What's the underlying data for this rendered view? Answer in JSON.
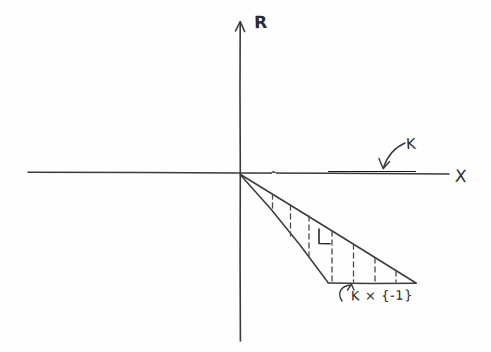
{
  "figure": {
    "kind": "hand-drawn-math-diagram",
    "background_color": "#fefefe",
    "ink_color": "#2b2b2b",
    "axes": {
      "vertical": {
        "label": "R",
        "name": "r-axis",
        "x": 240,
        "y_top": 22,
        "y_bottom": 341,
        "arrow_at": "top"
      },
      "horizontal": {
        "label": "X",
        "name": "x-axis",
        "y": 173,
        "x_left": 28,
        "x_right": 449,
        "arrow_at": "none"
      },
      "origin": {
        "x": 240,
        "y": 173
      }
    },
    "annotations": {
      "k_label": "K",
      "l_label": "L",
      "k_times_minus_one_label": "K × {-1}"
    },
    "segments": {
      "k_segment": {
        "name": "compact-set-k",
        "x_start": 328,
        "x_end": 416,
        "y": 172,
        "thickness": 5
      },
      "base_segment": {
        "name": "k-times-minus-one-segment",
        "x_start": 328,
        "x_end": 416,
        "y": 283,
        "thickness": 1.6
      }
    },
    "cone": {
      "name": "cone-region-l",
      "apex": {
        "x": 240,
        "y": 174
      },
      "upper_edge_end": {
        "x": 416,
        "y": 283
      },
      "lower_edge_end": {
        "x": 328,
        "y": 283
      },
      "dashed_line_x_positions": [
        272,
        290,
        309,
        332,
        353,
        375,
        396
      ]
    },
    "arrows": {
      "k_pointer": {
        "name": "k-callout-arrow",
        "from": {
          "x": 404,
          "y": 143
        },
        "to": {
          "x": 384,
          "y": 168
        }
      },
      "k_neg_pointer": {
        "name": "k-times-minus-one-callout-arrow",
        "from": {
          "x": 345,
          "y": 300
        },
        "to": {
          "x": 350,
          "y": 286
        }
      }
    }
  }
}
